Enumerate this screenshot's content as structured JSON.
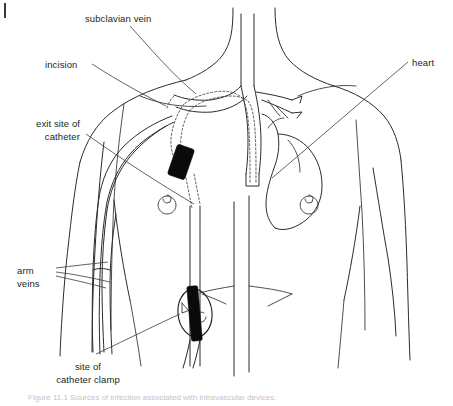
{
  "figure": {
    "page_marker": "page-rule-mark",
    "caption": "Figure 11.1   Sources of infection associated with intravascular devices."
  },
  "labels": [
    {
      "id": "subclavian-vein",
      "text": "subclavian vein",
      "lines": [
        "subclavian vein"
      ],
      "align": "start",
      "x": 85,
      "y": 22
    },
    {
      "id": "incision",
      "text": "incision",
      "lines": [
        "incision"
      ],
      "align": "start",
      "x": 45,
      "y": 68
    },
    {
      "id": "exit-site-of-catheter",
      "text": "exit site of catheter",
      "lines": [
        "exit site of",
        "catheter"
      ],
      "align": "end",
      "x": 80,
      "y": 127
    },
    {
      "id": "arm-veins",
      "text": "arm veins",
      "lines": [
        "arm",
        "veins"
      ],
      "align": "start",
      "x": 17,
      "y": 274
    },
    {
      "id": "site-of-catheter-clamp",
      "text": "site of catheter clamp",
      "lines": [
        "site of",
        "catheter clamp"
      ],
      "align": "middle",
      "x": 88,
      "y": 370
    },
    {
      "id": "heart",
      "text": "heart",
      "lines": [
        "heart"
      ],
      "align": "start",
      "x": 412,
      "y": 66
    }
  ],
  "label_text": {
    "subclavian_vein": "subclavian vein",
    "incision": "incision",
    "exit_site_line1": "exit site of",
    "exit_site_line2": "catheter",
    "arm_line1": "arm",
    "arm_line2": "veins",
    "clamp_line1": "site of",
    "clamp_line2": "catheter clamp",
    "heart": "heart"
  },
  "devices": {
    "cuff": {
      "name": "subcutaneous-dacron-cuff",
      "fill": "#0a0a0a"
    },
    "clamp": {
      "name": "catheter-clamp",
      "fill": "#0a0a0a"
    }
  },
  "colors": {
    "ink": "#231f20",
    "line": "#2b2b2b",
    "catheter": "#4a4a4a",
    "device": "#0a0a0a",
    "background": "#ffffff",
    "caption": "#8f9195"
  }
}
